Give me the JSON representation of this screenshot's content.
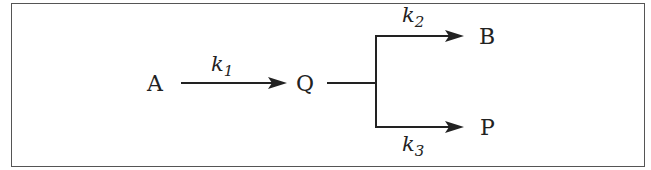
{
  "diagram": {
    "type": "reaction-scheme",
    "species": {
      "A": "A",
      "Q": "Q",
      "B": "B",
      "P": "P"
    },
    "rate_constants": {
      "k1": {
        "base": "k",
        "sub": "1"
      },
      "k2": {
        "base": "k",
        "sub": "2"
      },
      "k3": {
        "base": "k",
        "sub": "3"
      }
    },
    "edges": [
      {
        "from": "A",
        "to": "Q",
        "label": "k1"
      },
      {
        "from": "Q",
        "to": "B",
        "label": "k2"
      },
      {
        "from": "Q",
        "to": "P",
        "label": "k3"
      }
    ],
    "colors": {
      "stroke": "#222222",
      "frame": "#555555",
      "background": "#ffffff"
    }
  }
}
